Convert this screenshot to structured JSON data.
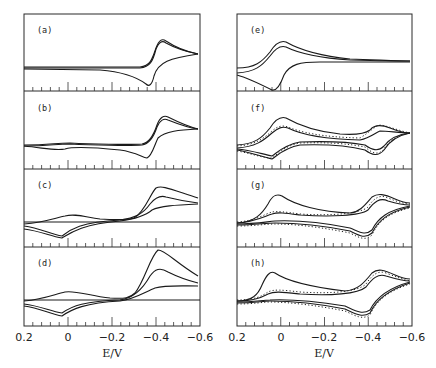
{
  "chart_data": {
    "type": "line",
    "title": "",
    "xlabel": "E/V",
    "ylabel": "",
    "xlim": [
      0.2,
      -0.6
    ],
    "x_ticks": [
      "0.2",
      "0",
      "-0.2",
      "-0.4",
      "-0.6"
    ],
    "grid": false,
    "legend": null,
    "layout": "2 columns x 4 rows, shared x axis per column",
    "panels": [
      {
        "label": "(a)",
        "column": 0,
        "row": 0,
        "description": "Single reversible wave near -0.40 V; anodic peak ~-0.37 V, cathodic peak ~-0.43 V",
        "series": [
          {
            "name": "CV",
            "style": "solid",
            "count": 2
          }
        ]
      },
      {
        "label": "(b)",
        "column": 0,
        "row": 1,
        "description": "Main wave near -0.40 V plus weak feature near 0 V",
        "series": [
          {
            "name": "CV",
            "style": "solid",
            "count": 3
          }
        ]
      },
      {
        "label": "(c)",
        "column": 0,
        "row": 2,
        "description": "Wave near 0 V (anodic ~0.02 V, cathodic ~-0.04 V) and growing cathodic peak near -0.42 V",
        "series": [
          {
            "name": "CV",
            "style": "solid",
            "count": 3
          }
        ]
      },
      {
        "label": "(d)",
        "column": 0,
        "row": 3,
        "description": "Larger cathodic peaks at -0.42 V, wave near 0 V",
        "series": [
          {
            "name": "CV",
            "style": "solid",
            "count": 3
          }
        ]
      },
      {
        "label": "(e)",
        "column": 1,
        "row": 0,
        "description": "Reversible wave near 0 V; anodic peak ~0.02 V, cathodic peak ~-0.03 V",
        "series": [
          {
            "name": "CV",
            "style": "solid",
            "count": 3
          }
        ]
      },
      {
        "label": "(f)",
        "column": 1,
        "row": 1,
        "description": "Waves at ~0 V and ~-0.40 V; experimental (solid) vs simulated (dotted)",
        "series": [
          {
            "name": "experiment",
            "style": "solid"
          },
          {
            "name": "simulation",
            "style": "dotted"
          }
        ]
      },
      {
        "label": "(g)",
        "column": 1,
        "row": 2,
        "description": "Decreasing 0 V wave, growing -0.40 V wave; solid vs dotted",
        "series": [
          {
            "name": "experiment",
            "style": "solid"
          },
          {
            "name": "simulation",
            "style": "dotted"
          }
        ]
      },
      {
        "label": "(h)",
        "column": 1,
        "row": 3,
        "description": "Strong 0 V oxidation peak first scan, -0.40 V wave; solid vs dotted",
        "series": [
          {
            "name": "experiment",
            "style": "solid"
          },
          {
            "name": "simulation",
            "style": "dotted"
          }
        ]
      }
    ]
  },
  "figure": {
    "panel_labels": [
      "(a)",
      "(b)",
      "(c)",
      "(d)",
      "(e)",
      "(f)",
      "(g)",
      "(h)"
    ],
    "x_tick_labels": [
      "0.2",
      "0",
      "−0.2",
      "−0.4",
      "−0.6"
    ],
    "x_axis_label": "E/V"
  }
}
